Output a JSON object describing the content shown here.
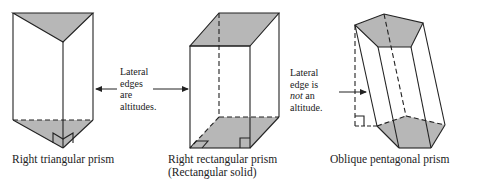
{
  "figure": {
    "colors": {
      "face_fill": "#b7b7b7",
      "stroke": "#222222",
      "background": "#ffffff"
    },
    "prisms": [
      {
        "id": "triangular",
        "caption": [
          "Right triangular prism"
        ]
      },
      {
        "id": "rectangular",
        "caption": [
          "Right rectangular prism",
          "(Rectangular solid)"
        ]
      },
      {
        "id": "pentagonal",
        "caption": [
          "Oblique pentagonal prism"
        ]
      }
    ],
    "annotations": {
      "right_prisms_note": [
        "Lateral",
        "edges",
        "are",
        "altitudes."
      ],
      "oblique_note": {
        "line1": "Lateral",
        "line2": "edge is",
        "line3_em": "not",
        "line3_rest": " an",
        "line4": "altitude."
      }
    }
  }
}
